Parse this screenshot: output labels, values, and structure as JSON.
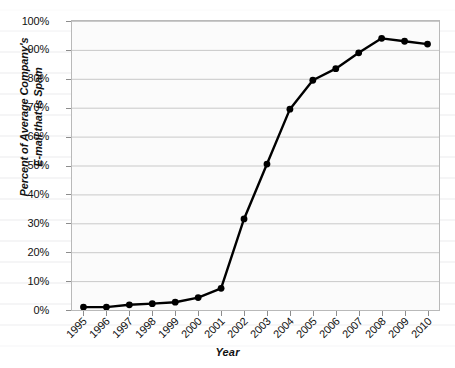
{
  "chart_data": {
    "type": "line",
    "title": "",
    "xlabel": "Year",
    "ylabel": "Percent of Average Company's E-mail that is Spam",
    "ylabel_line1": "Percent of Average Company's",
    "ylabel_line2": "E-mail that is Spam",
    "categories": [
      "1995",
      "1996",
      "1997",
      "1998",
      "1999",
      "2000",
      "2001",
      "2002",
      "2003",
      "2004",
      "2005",
      "2006",
      "2007",
      "2008",
      "2009",
      "2010"
    ],
    "values": [
      1,
      1,
      1.8,
      2.2,
      2.7,
      4.3,
      7.5,
      31.5,
      50.5,
      69.5,
      79.5,
      83.5,
      89,
      94,
      93,
      92
    ],
    "ylim": [
      0,
      100
    ],
    "ytick_values": [
      0,
      10,
      20,
      30,
      40,
      50,
      60,
      70,
      80,
      90,
      100
    ],
    "ytick_labels": [
      "0%",
      "10%",
      "20%",
      "30%",
      "40%",
      "50%",
      "60%",
      "70%",
      "80%",
      "90%",
      "100%"
    ],
    "grid": true,
    "grid_axis": "y",
    "legend": "none",
    "marker": "filled-circle",
    "series_color": "#000000",
    "plot_background": "#fbfbfb",
    "grid_color": "#c9c9c9",
    "axis_color": "#8d8d8d"
  }
}
